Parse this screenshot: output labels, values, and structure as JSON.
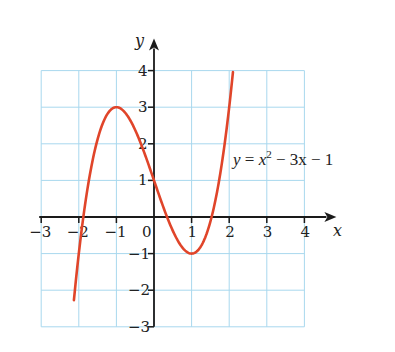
{
  "chart_data": {
    "type": "line",
    "title": "",
    "xlabel": "x",
    "ylabel": "y",
    "xlim": [
      -3,
      4
    ],
    "ylim": [
      -3,
      4
    ],
    "grid": true,
    "x_ticks": [
      "-3",
      "-2",
      "-1",
      "0",
      "1",
      "2",
      "3",
      "4"
    ],
    "y_ticks": [
      "-3",
      "-2",
      "-1",
      "1",
      "2",
      "3",
      "4"
    ],
    "series": [
      {
        "name": "y = x² − 3x − 1",
        "color": "#e0452a",
        "x": [
          -2.15,
          -2.0,
          -1.5,
          -1.0,
          -0.5,
          0.0,
          0.5,
          1.0,
          1.5,
          2.0,
          2.1
        ],
        "y": [
          -3.0,
          -1.0,
          2.125,
          3.0,
          2.375,
          1.0,
          -0.375,
          -1.0,
          -0.125,
          3.0,
          4.0
        ]
      }
    ],
    "annotations": [
      {
        "text": "y = x² − 3x − 1",
        "x": 2.1,
        "y": 1.5
      }
    ],
    "legend": "none"
  },
  "labels": {
    "x_axis": "x",
    "y_axis": "y",
    "origin": "0",
    "equation_y": "y",
    "equation_eq": " = ",
    "equation_x": "x",
    "equation_exp": "2",
    "equation_rest": " − 3x − 1"
  },
  "colors": {
    "grid": "#a8d8ee",
    "axis": "#1a1a1a",
    "curve": "#e0452a"
  }
}
